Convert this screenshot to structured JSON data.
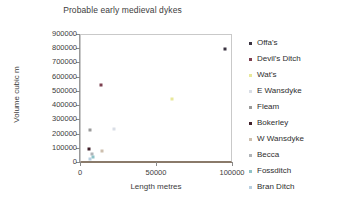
{
  "chart_data": {
    "type": "scatter",
    "title": "Probable early medieval dykes",
    "xlabel": "Length metres",
    "ylabel": "Volume cubic m",
    "xlim": [
      0,
      100000
    ],
    "ylim": [
      0,
      900000
    ],
    "grid": false,
    "legend_position": "right",
    "x_ticks": [
      "0",
      "50000",
      "100000"
    ],
    "x_tick_values": [
      0,
      50000,
      100000
    ],
    "y_ticks": [
      "0",
      "100000",
      "200000",
      "300000",
      "400000",
      "500000",
      "600000",
      "700000",
      "800000",
      "900000"
    ],
    "y_tick_values": [
      0,
      100000,
      200000,
      300000,
      400000,
      500000,
      600000,
      700000,
      800000,
      900000
    ],
    "series": [
      {
        "name": "Offa's",
        "x": 95000,
        "y": 800000,
        "color": "#3a3340",
        "marker": "square"
      },
      {
        "name": "Devil's Ditch",
        "x": 13000,
        "y": 550000,
        "color": "#7d4050",
        "marker": "square"
      },
      {
        "name": "Wat's",
        "x": 60000,
        "y": 450000,
        "color": "#e8e89a",
        "marker": "square"
      },
      {
        "name": "E Wansdyke",
        "x": 22000,
        "y": 240000,
        "color": "#d9dee6",
        "marker": "square"
      },
      {
        "name": "Fleam",
        "x": 6000,
        "y": 235000,
        "color": "#9a9a9a",
        "marker": "square"
      },
      {
        "name": "Bokerley",
        "x": 5500,
        "y": 100000,
        "color": "#40202a",
        "marker": "square"
      },
      {
        "name": "W Wansdyke",
        "x": 13500,
        "y": 85000,
        "color": "#cdbfae",
        "marker": "square"
      },
      {
        "name": "Becca",
        "x": 7000,
        "y": 60000,
        "color": "#b0b4b8",
        "marker": "square"
      },
      {
        "name": "Fossditch",
        "x": 8000,
        "y": 45000,
        "color": "#8fc3c8",
        "marker": "square"
      },
      {
        "name": "Bran Ditch",
        "x": 6000,
        "y": 30000,
        "color": "#b8cfe0",
        "marker": "square"
      }
    ]
  }
}
